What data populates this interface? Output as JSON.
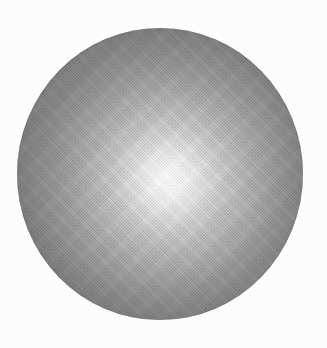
{
  "figure": {
    "background_color": "#fefefe",
    "canvas": {
      "width": 327,
      "height": 348
    }
  },
  "sphere": {
    "name": "shaded-sphere",
    "center_x": 160,
    "center_y": 174,
    "radius_x": 143,
    "radius_y": 146,
    "bounds": {
      "left": 17,
      "top": 28,
      "right": 303,
      "bottom": 320
    },
    "highlight": {
      "center_x_percent": 53,
      "center_y_percent": 52,
      "color": "#f7f7f7"
    },
    "rim_color": "#6e6e6e",
    "shading": "radial-gradient",
    "texture": "diagonal-halftone-dither"
  },
  "chart_data": {
    "type": "heatmap",
    "xlabel": "",
    "ylabel": "",
    "x": [
      0,
      5,
      10,
      16,
      23,
      30,
      37,
      44,
      51,
      58,
      65,
      72,
      79,
      86,
      93,
      100
    ],
    "series": [
      {
        "name": "Gray level (0-255) vs. normalized radius (%)",
        "values": [
          247,
          242,
          234,
          222,
          208,
          194,
          180,
          167,
          155,
          145,
          136,
          129,
          122,
          117,
          113,
          110
        ]
      }
    ],
    "colors": [
      "#f7f7f7",
      "#f2f2f2",
      "#eaeaea",
      "#dedede",
      "#d0d0d0",
      "#c2c2c2",
      "#b4b4b4",
      "#a7a7a7",
      "#9b9b9b",
      "#919191",
      "#888888",
      "#818181",
      "#7a7a7a",
      "#757575",
      "#717171",
      "#6e6e6e"
    ],
    "xlim": [
      0,
      100
    ],
    "ylim": [
      0,
      255
    ],
    "grid": false,
    "legend": false
  }
}
